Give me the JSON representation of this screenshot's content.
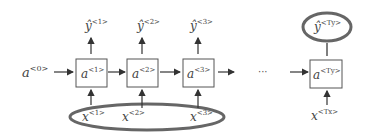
{
  "diagram": {
    "type": "many-to-one RNN unrolled",
    "initial_activation": {
      "base": "a",
      "sup": "<0>"
    },
    "cells": [
      {
        "base": "a",
        "sup": "<1>"
      },
      {
        "base": "a",
        "sup": "<2>"
      },
      {
        "base": "a",
        "sup": "<3>"
      },
      {
        "base": "a",
        "sup": "<Ty>"
      }
    ],
    "outputs": [
      {
        "base": "ŷ",
        "sup": "<1>"
      },
      {
        "base": "ŷ",
        "sup": "<2>"
      },
      {
        "base": "ŷ",
        "sup": "<3>"
      },
      {
        "base": "ŷ",
        "sup": "<Ty>"
      }
    ],
    "inputs": [
      {
        "base": "x",
        "sup": "<1>"
      },
      {
        "base": "x",
        "sup": "<2>"
      },
      {
        "base": "x",
        "sup": "<3>"
      },
      {
        "base": "x",
        "sup": "<Tx>"
      }
    ],
    "ellipsis": "···",
    "highlight_color": "#666666",
    "line_color": "#333333"
  }
}
